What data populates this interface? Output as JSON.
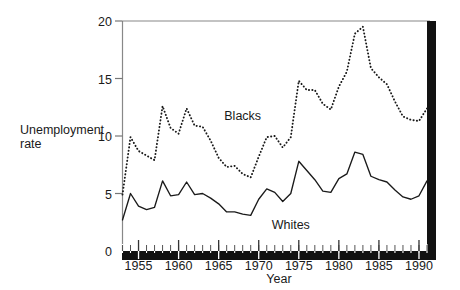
{
  "chart_data": {
    "type": "line",
    "title": "",
    "xlabel": "Year",
    "ylabel": "Unemployment rate",
    "ylabel_line1": "Unemployment",
    "ylabel_line2": "rate",
    "xlim": [
      1953,
      1991
    ],
    "ylim": [
      0,
      20
    ],
    "grid": false,
    "legend": "inline-annotations",
    "yticks": [
      0,
      5,
      10,
      15,
      20
    ],
    "ytick_labels": [
      "0",
      "5",
      "10",
      "15",
      "20"
    ],
    "xticks": [
      1955,
      1960,
      1965,
      1970,
      1975,
      1980,
      1985,
      1990
    ],
    "xtick_labels": [
      "1955",
      "1960",
      "1965",
      "1970",
      "1975",
      "1980",
      "1985",
      "1990"
    ],
    "x_minor_tick_step": 1,
    "x": [
      1953,
      1954,
      1955,
      1956,
      1957,
      1958,
      1959,
      1960,
      1961,
      1962,
      1963,
      1964,
      1965,
      1966,
      1967,
      1968,
      1969,
      1970,
      1971,
      1972,
      1973,
      1974,
      1975,
      1976,
      1977,
      1978,
      1979,
      1980,
      1981,
      1982,
      1983,
      1984,
      1985,
      1986,
      1987,
      1988,
      1989,
      1990,
      1991
    ],
    "series": [
      {
        "name": "Blacks",
        "style": "dotted",
        "color": "#1a1a1a",
        "label_x": 1968,
        "label_y": 11.4,
        "values": [
          4.9,
          9.9,
          8.7,
          8.3,
          7.9,
          12.6,
          10.7,
          10.2,
          12.4,
          10.9,
          10.8,
          9.6,
          8.1,
          7.3,
          7.4,
          6.7,
          6.4,
          8.2,
          9.9,
          10.0,
          9.0,
          9.9,
          14.8,
          14.0,
          14.0,
          12.8,
          12.3,
          14.3,
          15.6,
          18.9,
          19.5,
          15.9,
          15.1,
          14.5,
          13.0,
          11.7,
          11.4,
          11.3,
          12.4
        ]
      },
      {
        "name": "Whites",
        "style": "solid",
        "color": "#1a1a1a",
        "label_x": 1974,
        "label_y": 1.9,
        "values": [
          2.7,
          5.0,
          3.9,
          3.6,
          3.8,
          6.1,
          4.8,
          4.9,
          6.0,
          4.9,
          5.0,
          4.6,
          4.1,
          3.4,
          3.4,
          3.2,
          3.1,
          4.5,
          5.4,
          5.1,
          4.3,
          5.0,
          7.8,
          7.0,
          6.2,
          5.2,
          5.1,
          6.3,
          6.7,
          8.6,
          8.4,
          6.5,
          6.2,
          6.0,
          5.3,
          4.7,
          4.5,
          4.8,
          6.1
        ]
      }
    ]
  },
  "axis": {
    "x_axis_name": "Year",
    "y_axis_name_line1": "Unemployment",
    "y_axis_name_line2": "rate"
  }
}
